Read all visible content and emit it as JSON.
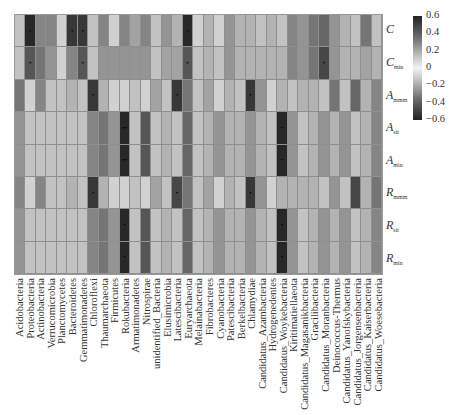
{
  "chart_data": {
    "type": "heatmap",
    "title": "",
    "xlabel": "",
    "ylabel": "",
    "rows": [
      "C",
      "C_min",
      "A_mmm",
      "A_sit",
      "A_min",
      "R_mmm",
      "R_sit",
      "R_min"
    ],
    "row_labels": [
      {
        "base": "C",
        "sub": ""
      },
      {
        "base": "C",
        "sub": "min"
      },
      {
        "base": "A",
        "sub": "mmm"
      },
      {
        "base": "A",
        "sub": "sit"
      },
      {
        "base": "A",
        "sub": "min"
      },
      {
        "base": "R",
        "sub": "mmm"
      },
      {
        "base": "R",
        "sub": "sit"
      },
      {
        "base": "R",
        "sub": "min"
      }
    ],
    "columns": [
      "Acidobacteria",
      "Proteobacteria",
      "Actinobacteria",
      "Verrucomicrobia",
      "Planctomycetes",
      "Bacteroidetes",
      "Gemmatimonadetes",
      "Chloroflexi",
      "Thaumarchaeota",
      "Firmicutes",
      "Rokubacteria",
      "Armatimonadetes",
      "Nitrospirae",
      "unidentified_Bacteria",
      "Elusimicrobia",
      "Latescibacteria",
      "Euryarchaeota",
      "Melainabacteria",
      "Fibrobacteres",
      "Cyanobacteria",
      "Patescibacteria",
      "Berkelbacteria",
      "Chlamydiae",
      "Candidatus_Azambacteria",
      "Hydrogenedentes",
      "Candidatus_Woykebacteria",
      "Kiritimatiellaeota",
      "Candidatus_Magasanikbacteria",
      "Gracilibacteria",
      "Candidatus_Moranbacteria",
      "Deinococcus-Thermus",
      "Candidatus_Yanofskybacteria",
      "Candidatus_Jorgensenbacteria",
      "Candidatus_Kaiserbacteria",
      "Candidatus_Woesebacteria"
    ],
    "colorbar": {
      "min": -0.6,
      "max": 0.6,
      "ticks": [
        "0.6",
        "0.4",
        "0.2",
        "0",
        "−0.2",
        "−0.4",
        "−0.6"
      ]
    },
    "values_abs": [
      [
        0.15,
        0.65,
        0.35,
        0.35,
        0.1,
        0.6,
        0.6,
        0.15,
        0.35,
        0.1,
        0.35,
        0.25,
        0.35,
        0.15,
        0.3,
        0.2,
        0.65,
        0.1,
        0.2,
        0.1,
        0.3,
        0.2,
        0.2,
        0.15,
        0.2,
        0.15,
        0.35,
        0.3,
        0.4,
        0.45,
        0.3,
        0.2,
        0.15,
        0.4,
        0.15
      ],
      [
        0.15,
        0.5,
        0.4,
        0.3,
        0.1,
        0.35,
        0.5,
        0.15,
        0.3,
        0.3,
        0.3,
        0.3,
        0.3,
        0.15,
        0.25,
        0.25,
        0.5,
        0.15,
        0.2,
        0.15,
        0.3,
        0.2,
        0.2,
        0.2,
        0.2,
        0.2,
        0.35,
        0.3,
        0.4,
        0.55,
        0.3,
        0.2,
        0.2,
        0.25,
        0.2
      ],
      [
        0.4,
        0.1,
        0.35,
        0.15,
        0.15,
        0.2,
        0.15,
        0.6,
        0.2,
        0.1,
        0.1,
        0.15,
        0.1,
        0.25,
        0.15,
        0.6,
        0.4,
        0.15,
        0.25,
        0.1,
        0.2,
        0.15,
        0.6,
        0.3,
        0.1,
        0.2,
        0.15,
        0.2,
        0.2,
        0.15,
        0.4,
        0.15,
        0.45,
        0.2,
        0.35
      ],
      [
        0.3,
        0.15,
        0.15,
        0.15,
        0.15,
        0.15,
        0.15,
        0.35,
        0.4,
        0.3,
        0.65,
        0.15,
        0.5,
        0.15,
        0.2,
        0.15,
        0.45,
        0.15,
        0.2,
        0.3,
        0.2,
        0.2,
        0.3,
        0.2,
        0.15,
        0.65,
        0.3,
        0.15,
        0.2,
        0.3,
        0.2,
        0.3,
        0.15,
        0.2,
        0.35
      ],
      [
        0.3,
        0.15,
        0.15,
        0.15,
        0.15,
        0.15,
        0.15,
        0.35,
        0.4,
        0.3,
        0.65,
        0.15,
        0.5,
        0.15,
        0.2,
        0.15,
        0.45,
        0.15,
        0.2,
        0.3,
        0.2,
        0.2,
        0.3,
        0.2,
        0.15,
        0.65,
        0.3,
        0.15,
        0.2,
        0.3,
        0.2,
        0.3,
        0.15,
        0.2,
        0.35
      ],
      [
        0.35,
        0.1,
        0.35,
        0.15,
        0.15,
        0.2,
        0.15,
        0.6,
        0.2,
        0.1,
        0.1,
        0.15,
        0.1,
        0.25,
        0.15,
        0.55,
        0.4,
        0.15,
        0.25,
        0.1,
        0.2,
        0.15,
        0.6,
        0.3,
        0.1,
        0.2,
        0.2,
        0.2,
        0.2,
        0.15,
        0.3,
        0.15,
        0.55,
        0.2,
        0.4
      ],
      [
        0.3,
        0.15,
        0.15,
        0.15,
        0.15,
        0.15,
        0.15,
        0.35,
        0.4,
        0.3,
        0.65,
        0.15,
        0.5,
        0.15,
        0.2,
        0.15,
        0.45,
        0.15,
        0.2,
        0.3,
        0.2,
        0.2,
        0.3,
        0.2,
        0.15,
        0.65,
        0.3,
        0.15,
        0.2,
        0.3,
        0.2,
        0.3,
        0.15,
        0.2,
        0.35
      ],
      [
        0.3,
        0.15,
        0.15,
        0.15,
        0.15,
        0.15,
        0.15,
        0.35,
        0.4,
        0.3,
        0.65,
        0.15,
        0.5,
        0.15,
        0.2,
        0.15,
        0.45,
        0.15,
        0.2,
        0.3,
        0.2,
        0.2,
        0.3,
        0.2,
        0.15,
        0.65,
        0.3,
        0.15,
        0.2,
        0.3,
        0.2,
        0.3,
        0.15,
        0.2,
        0.35
      ]
    ],
    "significance": [
      {
        "row": 0,
        "col": 1,
        "mark": "*"
      },
      {
        "row": 0,
        "col": 5,
        "mark": "*"
      },
      {
        "row": 0,
        "col": 6,
        "mark": "*"
      },
      {
        "row": 0,
        "col": 16,
        "mark": "*"
      },
      {
        "row": 1,
        "col": 1,
        "mark": "*"
      },
      {
        "row": 1,
        "col": 6,
        "mark": "*"
      },
      {
        "row": 1,
        "col": 16,
        "mark": "*"
      },
      {
        "row": 1,
        "col": 29,
        "mark": "*"
      },
      {
        "row": 2,
        "col": 7,
        "mark": "*"
      },
      {
        "row": 2,
        "col": 15,
        "mark": "*"
      },
      {
        "row": 2,
        "col": 22,
        "mark": "*"
      },
      {
        "row": 3,
        "col": 10,
        "mark": "**"
      },
      {
        "row": 3,
        "col": 25,
        "mark": "*"
      },
      {
        "row": 4,
        "col": 10,
        "mark": "**"
      },
      {
        "row": 4,
        "col": 25,
        "mark": "*"
      },
      {
        "row": 5,
        "col": 7,
        "mark": "*"
      },
      {
        "row": 5,
        "col": 15,
        "mark": "*"
      },
      {
        "row": 5,
        "col": 22,
        "mark": "*"
      },
      {
        "row": 6,
        "col": 10,
        "mark": "*"
      },
      {
        "row": 6,
        "col": 25,
        "mark": "*"
      },
      {
        "row": 7,
        "col": 10,
        "mark": "*"
      },
      {
        "row": 7,
        "col": 25,
        "mark": "*"
      }
    ],
    "grid": true,
    "legend_position": "right"
  }
}
